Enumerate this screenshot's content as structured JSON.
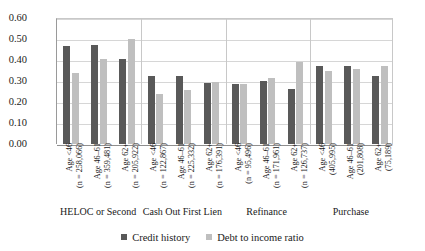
{
  "chart_data": {
    "type": "bar",
    "title": "",
    "xlabel": "",
    "ylabel": "Percentage Denied",
    "ylim": [
      0.0,
      0.6
    ],
    "ytick_labels": [
      "0.60",
      "0.50",
      "0.40",
      "0.30",
      "0.20",
      "0.10",
      "0.00"
    ],
    "ytick_values": [
      0.6,
      0.5,
      0.4,
      0.3,
      0.2,
      0.1,
      0.0
    ],
    "grid": true,
    "legend_position": "bottom",
    "groups": [
      {
        "label": "HELOC or Second",
        "categories": [
          {
            "age": "Age <46",
            "count": "(n = 258,066)"
          },
          {
            "age": "Age 46–61",
            "count": "(n = 359,481)"
          },
          {
            "age": "Age 62+",
            "count": "(n = 205,922)"
          }
        ]
      },
      {
        "label": "Cash Out First Lien",
        "categories": [
          {
            "age": "Age <46",
            "count": "(n = 122,867)"
          },
          {
            "age": "Age 46–61",
            "count": "(n = 225,332)"
          },
          {
            "age": "Age 62+",
            "count": "(n = 176,391)"
          }
        ]
      },
      {
        "label": "Refinance",
        "categories": [
          {
            "age": "Age <46",
            "count": "(n = 95,496)"
          },
          {
            "age": "Age 46–61",
            "count": "(n = 171,961)"
          },
          {
            "age": "Age 62+",
            "count": "(n = 126,737)"
          }
        ]
      },
      {
        "label": "Purchase",
        "categories": [
          {
            "age": "Age <46",
            "count": "(405,995)"
          },
          {
            "age": "Age 46–61",
            "count": "(201,808)"
          },
          {
            "age": "Age 62+",
            "count": "(75,189)"
          }
        ]
      }
    ],
    "categories": [
      "HELOC or Second / Age <46 (n = 258,066)",
      "HELOC or Second / Age 46–61 (n = 359,481)",
      "HELOC or Second / Age 62+ (n = 205,922)",
      "Cash Out First Lien / Age <46 (n = 122,867)",
      "Cash Out First Lien / Age 46–61 (n = 225,332)",
      "Cash Out First Lien / Age 62+ (n = 176,391)",
      "Refinance / Age <46 (n = 95,496)",
      "Refinance / Age 46–61 (n = 171,961)",
      "Refinance / Age 62+ (n = 126,737)",
      "Purchase / Age <46 (405,995)",
      "Purchase / Age 46–61 (201,808)",
      "Purchase / Age 62+ (75,189)"
    ],
    "series": [
      {
        "name": "Credit history",
        "color": "#595959",
        "values": [
          0.465,
          0.47,
          0.405,
          0.325,
          0.325,
          0.29,
          0.285,
          0.3,
          0.26,
          0.37,
          0.37,
          0.325
        ]
      },
      {
        "name": "Debt to income ratio",
        "color": "#bfbfbf",
        "values": [
          0.34,
          0.405,
          0.5,
          0.24,
          0.255,
          0.295,
          0.285,
          0.315,
          0.39,
          0.35,
          0.355,
          0.37
        ]
      }
    ]
  }
}
